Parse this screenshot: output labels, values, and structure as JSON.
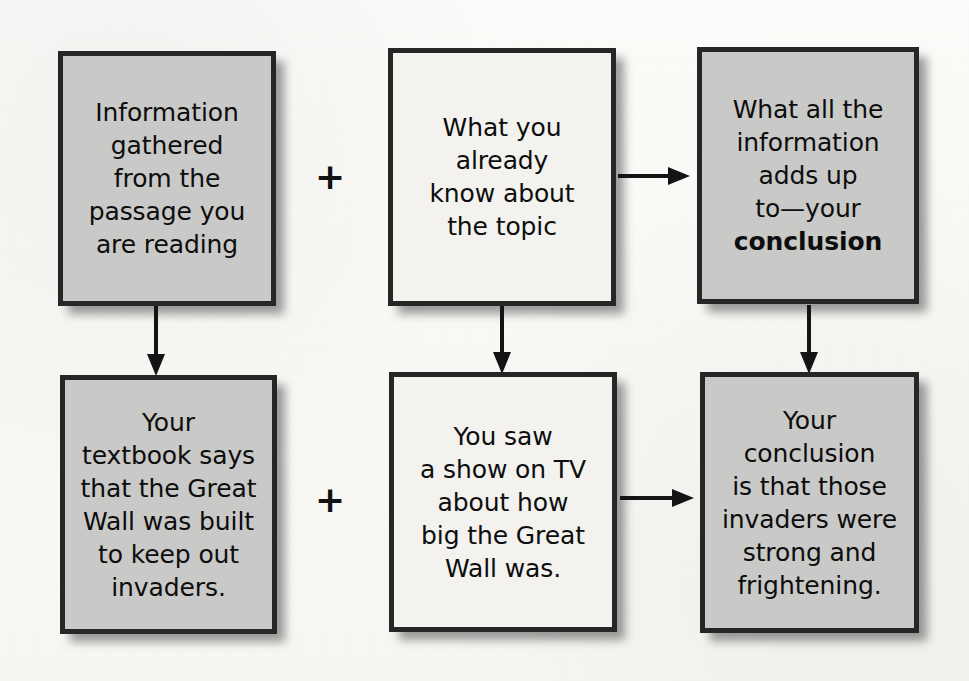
{
  "diagram": {
    "type": "flow-diagram",
    "background_color": "#fcfbf9",
    "border_color": "#262626",
    "text_color": "#0d0d0d",
    "fill_gray": "#c9c9c7",
    "fill_light": "#f3f2ef",
    "rows": [
      {
        "id": "row-1",
        "kind": "general",
        "nodes": [
          {
            "id": "r1c1",
            "text": "Information\ngathered\nfrom the\npassage you\nare reading",
            "fill": "gray"
          },
          {
            "id": "r1c2",
            "text": "What you\nalready\nknow about\nthe topic",
            "fill": "light"
          },
          {
            "id": "r1c3",
            "text_before_bold": "What all the\ninformation\nadds up\nto—your\n",
            "text_bold": "conclusion",
            "fill": "gray"
          }
        ],
        "operator_plus": "+",
        "operator_arrow": "arrow-right-icon"
      },
      {
        "id": "row-2",
        "kind": "example",
        "nodes": [
          {
            "id": "r2c1",
            "text": "Your\ntextbook says\nthat the Great\nWall was built\nto keep out\ninvaders.",
            "fill": "gray"
          },
          {
            "id": "r2c2",
            "text": "You saw\na show on TV\nabout how\nbig the Great\nWall was.",
            "fill": "light"
          },
          {
            "id": "r2c3",
            "text": "Your\nconclusion\nis that those\ninvaders were\nstrong and\nfrightening.",
            "fill": "gray"
          }
        ],
        "operator_plus": "+",
        "operator_arrow": "arrow-right-icon"
      }
    ],
    "vertical_connectors": [
      {
        "id": "col-1",
        "icon": "arrow-down-icon"
      },
      {
        "id": "col-2",
        "icon": "arrow-down-icon"
      },
      {
        "id": "col-3",
        "icon": "arrow-down-icon"
      }
    ]
  }
}
